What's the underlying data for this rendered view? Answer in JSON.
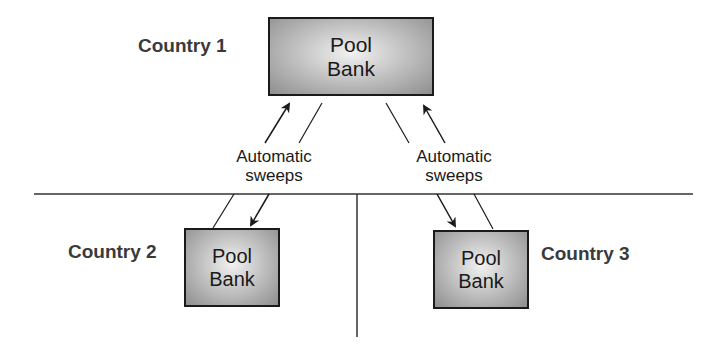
{
  "diagram": {
    "type": "cash-pooling-structure",
    "country_1": {
      "label": "Country 1",
      "bank_line_1": "Pool",
      "bank_line_2": "Bank"
    },
    "country_2": {
      "label": "Country 2",
      "bank_line_1": "Pool",
      "bank_line_2": "Bank"
    },
    "country_3": {
      "label": "Country 3",
      "bank_line_1": "Pool",
      "bank_line_2": "Bank"
    },
    "connectors": {
      "left": {
        "line_1": "Automatic",
        "line_2": "sweeps"
      },
      "right": {
        "line_1": "Automatic",
        "line_2": "sweeps"
      }
    },
    "colors": {
      "line": "#1a1a1a",
      "label": "#3a3a3a",
      "box_center": "#f2f2f2",
      "box_edge": "#8e8e8e"
    }
  }
}
